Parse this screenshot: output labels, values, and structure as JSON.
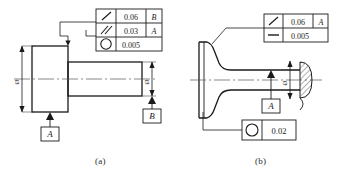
{
  "figure": {
    "caption_a": "(a)",
    "caption_b": "(b)"
  },
  "part_a": {
    "control_frame": {
      "rows": [
        {
          "symbol": "circular-runout",
          "tolerance": "0.06",
          "datum": "B"
        },
        {
          "symbol": "parallelism",
          "tolerance": "0.03",
          "datum": "A"
        },
        {
          "symbol": "circularity",
          "tolerance": "0.005",
          "datum": ""
        }
      ]
    },
    "datums": [
      {
        "label": "A",
        "position": "bottom-left"
      },
      {
        "label": "B",
        "position": "bottom-right"
      }
    ],
    "dimensions": [
      {
        "label": "ø",
        "position": "left"
      },
      {
        "label": "ø",
        "position": "right"
      }
    ]
  },
  "part_b": {
    "control_frame": {
      "rows": [
        {
          "symbol": "circular-runout",
          "tolerance": "0.06",
          "datum": "A"
        },
        {
          "symbol": "flatness",
          "tolerance": "0.005",
          "datum": ""
        }
      ]
    },
    "lower_frame": {
      "symbol": "circularity",
      "tolerance": "0.02"
    },
    "datums": [
      {
        "label": "A",
        "position": "bottom-center"
      }
    ],
    "dimensions": [
      {
        "label": "ø",
        "position": "center"
      }
    ]
  },
  "colors": {
    "line": "#1a1a1a",
    "thin_line": "#444444",
    "background": "#ffffff"
  }
}
